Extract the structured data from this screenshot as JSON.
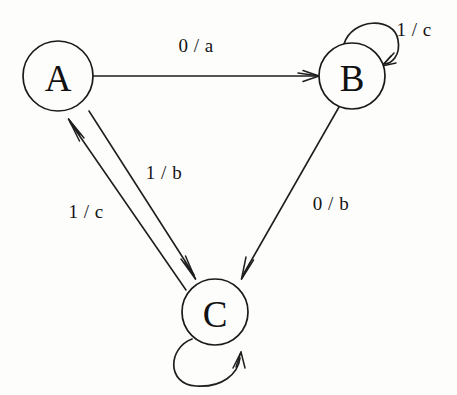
{
  "diagram": {
    "kind": "finite-state-machine",
    "background_color": "#fdfdfc",
    "stroke_color": "#1f1f1f",
    "states": [
      {
        "id": "A",
        "label": "A",
        "cx": 58,
        "cy": 76,
        "r": 35
      },
      {
        "id": "B",
        "label": "B",
        "cx": 352,
        "cy": 76,
        "r": 33
      },
      {
        "id": "C",
        "label": "C",
        "cx": 215,
        "cy": 312,
        "r": 33
      }
    ],
    "transitions": [
      {
        "id": "a-to-b",
        "from": "A",
        "to": "B",
        "input": "0",
        "output": "a",
        "label": "0 / a",
        "label_x": 196,
        "label_y": 45,
        "kind": "straight"
      },
      {
        "id": "b-to-b",
        "from": "B",
        "to": "B",
        "input": "1",
        "output": "c",
        "label": "1 / c",
        "label_x": 414,
        "label_y": 29,
        "kind": "self-loop"
      },
      {
        "id": "b-to-c",
        "from": "B",
        "to": "C",
        "input": "0",
        "output": "b",
        "label": "0 / b",
        "label_x": 331,
        "label_y": 203,
        "kind": "straight"
      },
      {
        "id": "a-to-c",
        "from": "A",
        "to": "C",
        "input": "1",
        "output": "b",
        "label": "1 / b",
        "label_x": 164,
        "label_y": 172,
        "kind": "straight"
      },
      {
        "id": "c-to-a",
        "from": "C",
        "to": "A",
        "input": "1",
        "output": "c",
        "label": "1 / c",
        "label_x": 86,
        "label_y": 211,
        "kind": "straight"
      },
      {
        "id": "c-to-c",
        "from": "C",
        "to": "C",
        "input": "1",
        "output": "?",
        "label": "",
        "label_x": 215,
        "label_y": 385,
        "kind": "self-loop"
      }
    ]
  }
}
